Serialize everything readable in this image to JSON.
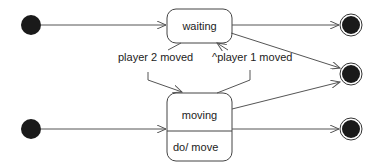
{
  "diagram": {
    "type": "UML state machine",
    "states": [
      {
        "id": "waiting",
        "label": "waiting"
      },
      {
        "id": "moving",
        "label": "moving",
        "activity": "do/ move"
      }
    ],
    "initial_states": 2,
    "final_states": 3,
    "transitions": [
      {
        "from": "initial-1",
        "to": "waiting",
        "label": ""
      },
      {
        "from": "initial-2",
        "to": "moving",
        "label": ""
      },
      {
        "from": "waiting",
        "to": "moving",
        "label": "player 2 moved"
      },
      {
        "from": "moving",
        "to": "waiting",
        "label": "^player 1 moved"
      },
      {
        "from": "waiting",
        "to": "final-1",
        "label": ""
      },
      {
        "from": "waiting",
        "to": "final-2",
        "label": ""
      },
      {
        "from": "moving",
        "to": "final-2",
        "label": ""
      },
      {
        "from": "moving",
        "to": "final-3",
        "label": ""
      }
    ],
    "colors": {
      "line": "#555555",
      "fill": "#1a1a1a",
      "box": "#ffffff"
    }
  }
}
